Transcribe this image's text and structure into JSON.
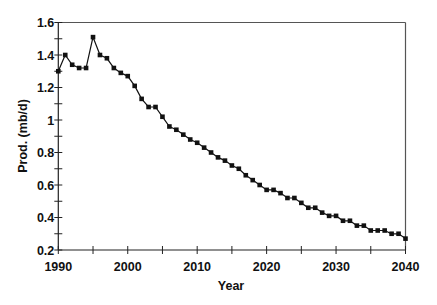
{
  "chart_data": {
    "type": "line",
    "title": "",
    "xlabel": "Year",
    "ylabel": "Prod. (mb/d)",
    "xlim": [
      1990,
      2040
    ],
    "ylim": [
      0.2,
      1.6
    ],
    "x_ticks": [
      1990,
      2000,
      2010,
      2020,
      2030,
      2040
    ],
    "x_tick_labels": [
      "1990",
      "2000",
      "2010",
      "2020",
      "2030",
      "2040"
    ],
    "x_minor_step": 5,
    "y_ticks": [
      0.2,
      0.4,
      0.6,
      0.8,
      1.0,
      1.2,
      1.4,
      1.6
    ],
    "y_tick_labels": [
      "0.2",
      "0.4",
      "0.6",
      "0.8",
      "1",
      "1.2",
      "1.4",
      "1.6"
    ],
    "y_minor_step": 0.1,
    "grid": false,
    "legend": null,
    "marker": "square",
    "series": [
      {
        "name": "Production",
        "color": "#111111",
        "x": [
          1990,
          1991,
          1992,
          1993,
          1994,
          1995,
          1996,
          1997,
          1998,
          1999,
          2000,
          2001,
          2002,
          2003,
          2004,
          2005,
          2006,
          2007,
          2008,
          2009,
          2010,
          2011,
          2012,
          2013,
          2014,
          2015,
          2016,
          2017,
          2018,
          2019,
          2020,
          2021,
          2022,
          2023,
          2024,
          2025,
          2026,
          2027,
          2028,
          2029,
          2030,
          2031,
          2032,
          2033,
          2034,
          2035,
          2036,
          2037,
          2038,
          2039,
          2040
        ],
        "values": [
          1.3,
          1.4,
          1.34,
          1.32,
          1.32,
          1.51,
          1.4,
          1.38,
          1.32,
          1.29,
          1.27,
          1.21,
          1.13,
          1.08,
          1.08,
          1.02,
          0.96,
          0.94,
          0.91,
          0.88,
          0.86,
          0.83,
          0.8,
          0.77,
          0.75,
          0.72,
          0.7,
          0.66,
          0.63,
          0.6,
          0.57,
          0.57,
          0.55,
          0.52,
          0.52,
          0.49,
          0.46,
          0.46,
          0.43,
          0.41,
          0.41,
          0.38,
          0.38,
          0.35,
          0.35,
          0.32,
          0.32,
          0.32,
          0.3,
          0.3,
          0.27
        ]
      }
    ]
  }
}
